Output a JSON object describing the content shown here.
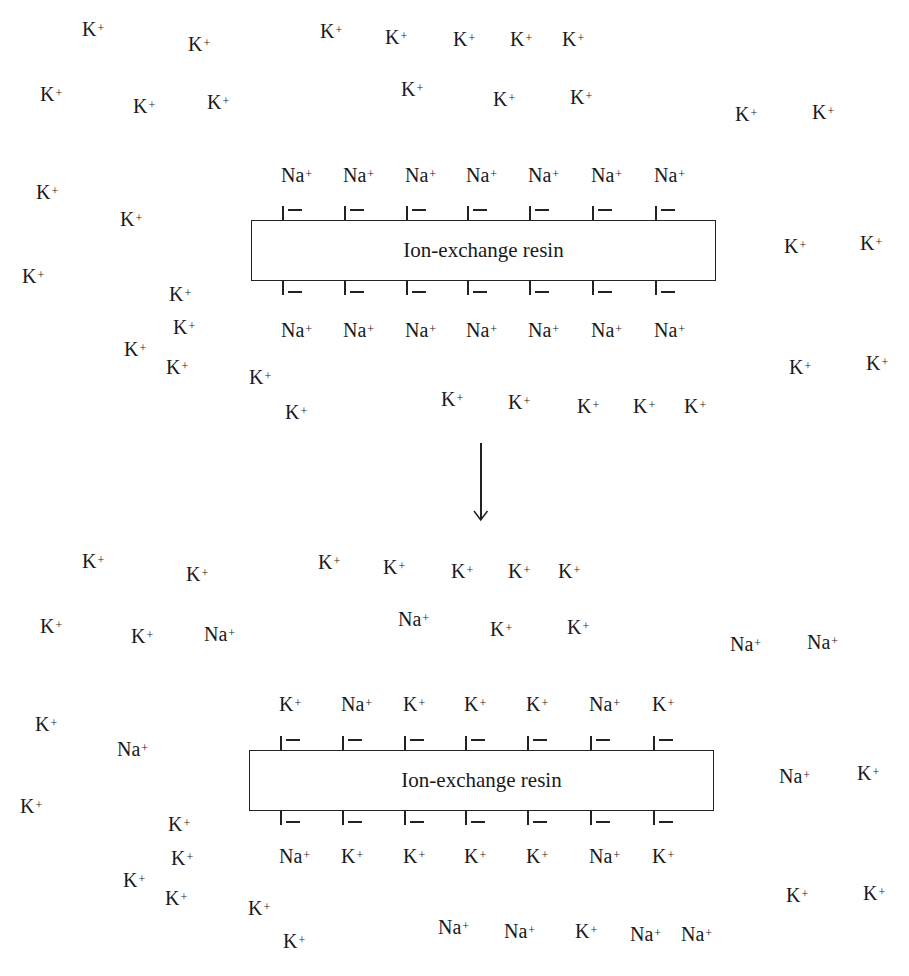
{
  "panels": [
    {
      "name": "before",
      "resin_label": "Ion-exchange resin",
      "resin_box": {
        "x": 251,
        "y": 220,
        "w": 465,
        "h": 61
      },
      "top_bound_ions": [
        "Na+",
        "Na+",
        "Na+",
        "Na+",
        "Na+",
        "Na+",
        "Na+"
      ],
      "bottom_bound_ions": [
        "Na+",
        "Na+",
        "Na+",
        "Na+",
        "Na+",
        "Na+",
        "Na+"
      ],
      "site_x": [
        282,
        344,
        406,
        467,
        529,
        592,
        655
      ],
      "top_label_y": 164,
      "bottom_label_y": 319,
      "free_ions": [
        {
          "ion": "K",
          "x": 82,
          "y": 18
        },
        {
          "ion": "K",
          "x": 188,
          "y": 33
        },
        {
          "ion": "K",
          "x": 320,
          "y": 20
        },
        {
          "ion": "K",
          "x": 385,
          "y": 26
        },
        {
          "ion": "K",
          "x": 453,
          "y": 28
        },
        {
          "ion": "K",
          "x": 510,
          "y": 28
        },
        {
          "ion": "K",
          "x": 562,
          "y": 28
        },
        {
          "ion": "K",
          "x": 40,
          "y": 83
        },
        {
          "ion": "K",
          "x": 133,
          "y": 95
        },
        {
          "ion": "K",
          "x": 207,
          "y": 91
        },
        {
          "ion": "K",
          "x": 401,
          "y": 78
        },
        {
          "ion": "K",
          "x": 493,
          "y": 88
        },
        {
          "ion": "K",
          "x": 570,
          "y": 86
        },
        {
          "ion": "K",
          "x": 735,
          "y": 103
        },
        {
          "ion": "K",
          "x": 812,
          "y": 101
        },
        {
          "ion": "K",
          "x": 36,
          "y": 181
        },
        {
          "ion": "K",
          "x": 120,
          "y": 208
        },
        {
          "ion": "K",
          "x": 22,
          "y": 265
        },
        {
          "ion": "K",
          "x": 169,
          "y": 283
        },
        {
          "ion": "K",
          "x": 173,
          "y": 316
        },
        {
          "ion": "K",
          "x": 124,
          "y": 338
        },
        {
          "ion": "K",
          "x": 166,
          "y": 356
        },
        {
          "ion": "K",
          "x": 249,
          "y": 366
        },
        {
          "ion": "K",
          "x": 285,
          "y": 401
        },
        {
          "ion": "K",
          "x": 441,
          "y": 388
        },
        {
          "ion": "K",
          "x": 508,
          "y": 391
        },
        {
          "ion": "K",
          "x": 577,
          "y": 395
        },
        {
          "ion": "K",
          "x": 633,
          "y": 395
        },
        {
          "ion": "K",
          "x": 684,
          "y": 395
        },
        {
          "ion": "K",
          "x": 784,
          "y": 235
        },
        {
          "ion": "K",
          "x": 860,
          "y": 232
        },
        {
          "ion": "K",
          "x": 789,
          "y": 356
        },
        {
          "ion": "K",
          "x": 866,
          "y": 352
        }
      ]
    },
    {
      "name": "after",
      "resin_label": "Ion-exchange resin",
      "resin_box": {
        "x": 249,
        "y": 750,
        "w": 465,
        "h": 61
      },
      "top_bound_ions": [
        "K+",
        "Na+",
        "K+",
        "K+",
        "K+",
        "Na+",
        "K+"
      ],
      "bottom_bound_ions": [
        "Na+",
        "K+",
        "K+",
        "K+",
        "K+",
        "Na+",
        "K+"
      ],
      "site_x": [
        280,
        342,
        404,
        465,
        527,
        590,
        653
      ],
      "top_label_y": 693,
      "bottom_label_y": 845,
      "free_ions": [
        {
          "ion": "K",
          "x": 82,
          "y": 550
        },
        {
          "ion": "K",
          "x": 186,
          "y": 563
        },
        {
          "ion": "K",
          "x": 318,
          "y": 551
        },
        {
          "ion": "K",
          "x": 383,
          "y": 556
        },
        {
          "ion": "K",
          "x": 451,
          "y": 560
        },
        {
          "ion": "K",
          "x": 508,
          "y": 560
        },
        {
          "ion": "K",
          "x": 558,
          "y": 560
        },
        {
          "ion": "K",
          "x": 40,
          "y": 615
        },
        {
          "ion": "K",
          "x": 131,
          "y": 625
        },
        {
          "ion": "Na",
          "x": 204,
          "y": 623
        },
        {
          "ion": "Na",
          "x": 398,
          "y": 608
        },
        {
          "ion": "K",
          "x": 490,
          "y": 618
        },
        {
          "ion": "K",
          "x": 567,
          "y": 616
        },
        {
          "ion": "Na",
          "x": 730,
          "y": 633
        },
        {
          "ion": "Na",
          "x": 807,
          "y": 631
        },
        {
          "ion": "K",
          "x": 35,
          "y": 713
        },
        {
          "ion": "Na",
          "x": 117,
          "y": 738
        },
        {
          "ion": "K",
          "x": 20,
          "y": 795
        },
        {
          "ion": "K",
          "x": 168,
          "y": 813
        },
        {
          "ion": "K",
          "x": 171,
          "y": 847
        },
        {
          "ion": "K",
          "x": 123,
          "y": 869
        },
        {
          "ion": "K",
          "x": 165,
          "y": 887
        },
        {
          "ion": "K",
          "x": 248,
          "y": 897
        },
        {
          "ion": "K",
          "x": 283,
          "y": 930
        },
        {
          "ion": "Na",
          "x": 438,
          "y": 916
        },
        {
          "ion": "Na",
          "x": 504,
          "y": 920
        },
        {
          "ion": "K",
          "x": 575,
          "y": 920
        },
        {
          "ion": "Na",
          "x": 630,
          "y": 923
        },
        {
          "ion": "Na",
          "x": 681,
          "y": 923
        },
        {
          "ion": "Na",
          "x": 779,
          "y": 765
        },
        {
          "ion": "K",
          "x": 857,
          "y": 762
        },
        {
          "ion": "K",
          "x": 786,
          "y": 884
        },
        {
          "ion": "K",
          "x": 863,
          "y": 882
        }
      ]
    }
  ],
  "arrow": {
    "x": 480,
    "y1": 443,
    "y2": 520,
    "direction": "down"
  },
  "colors": {
    "ink": "#1a1a1a",
    "background": "#ffffff"
  }
}
